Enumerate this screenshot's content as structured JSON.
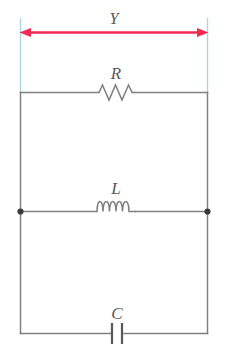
{
  "diagram": {
    "type": "circuit-schematic",
    "background_color": "#ffffff",
    "wire_color": "#808080",
    "label_color": "#58585a",
    "dimension_color": "#ee2b52",
    "extension_line_color": "#aed4e6"
  },
  "dimension": {
    "label": "Y",
    "style": "double-headed-arrow",
    "spans": "full circuit width",
    "color": "#ee2b52"
  },
  "components": [
    {
      "id": "resistor",
      "label": "R",
      "symbol": "zigzag",
      "branch": "top",
      "peaks": 4
    },
    {
      "id": "inductor",
      "label": "L",
      "symbol": "coil",
      "branch": "middle",
      "loops": 4
    },
    {
      "id": "capacitor",
      "label": "C",
      "symbol": "parallel-plates",
      "branch": "bottom",
      "plates": 2
    }
  ],
  "nodes": [
    {
      "id": "left-junction",
      "marker": "filled-dot"
    },
    {
      "id": "right-junction",
      "marker": "filled-dot"
    }
  ]
}
